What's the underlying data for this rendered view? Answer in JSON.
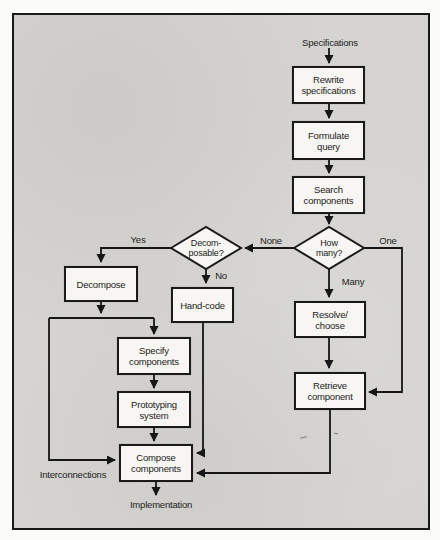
{
  "palette": {
    "page_background": "#fbfbf8",
    "panel_background": "#d5d4d0",
    "box_fill": "#f7f6f2",
    "line_color": "#161616",
    "text_color": "#1c1c1c"
  },
  "nodes": {
    "specifications_label": "Specifications",
    "rewrite": "Rewrite\nspecifications",
    "formulate": "Formulate\nquery",
    "search": "Search\ncomponents",
    "how_many": "How\nmany?",
    "decomposable": "Decom-\nposable?",
    "decompose": "Decompose",
    "hand_code": "Hand-code",
    "resolve": "Resolve/\nchoose",
    "retrieve": "Retrieve\ncomponent",
    "specify": "Specify\ncomponents",
    "prototyping": "Prototyping\nsystem",
    "compose": "Compose\ncomponents",
    "implementation_label": "Implementation"
  },
  "edge_labels": {
    "yes": "Yes",
    "no": "No",
    "none": "None",
    "one": "One",
    "many": "Many",
    "interconnections": "Interconnections"
  }
}
